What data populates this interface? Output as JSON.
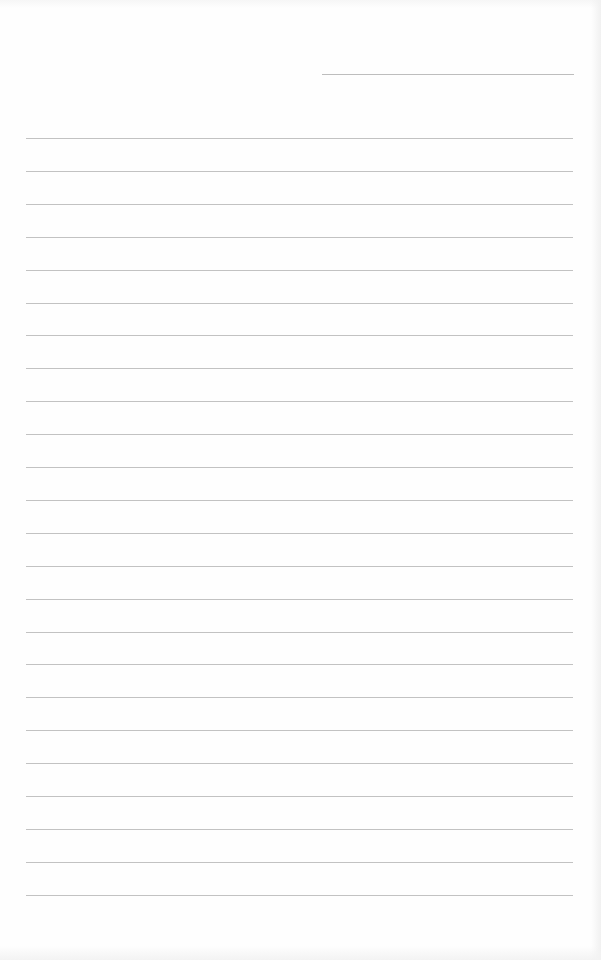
{
  "page": {
    "type": "blank-lined-paper",
    "background_color": "#fefefe",
    "line_color": "#c2c2c2",
    "header_line": {
      "top": 74,
      "left": 322,
      "width": 252
    },
    "rules": {
      "count": 24,
      "first_top": 138,
      "spacing": 32.9,
      "left": 26,
      "width": 547
    }
  }
}
